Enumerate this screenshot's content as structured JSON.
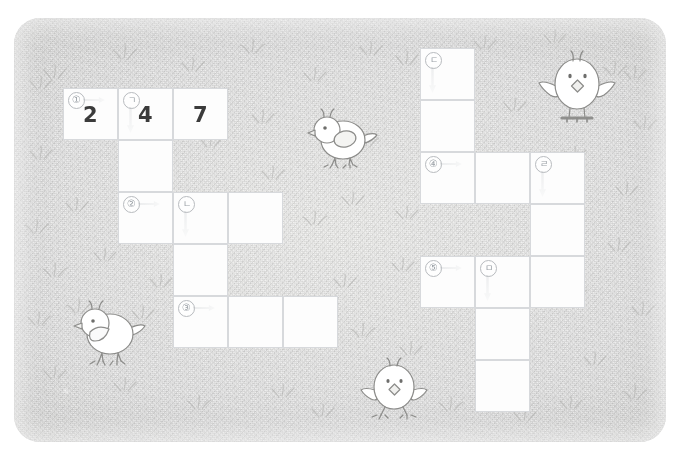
{
  "scene": {
    "title": "Korean crossword puzzle on grass background",
    "background_color": "#dcdcda",
    "card_color": "#fdfdfd",
    "ink_color": "#3b3b3b",
    "marker_color": "#9aa0a6",
    "border_color": "#d7d9dc"
  },
  "puzzle": {
    "name": "gaero-sero-crossword",
    "grids": [
      {
        "name": "left-grid",
        "cells": [
          {
            "id": "L-r1c1",
            "row": 1,
            "col": 1,
            "marker": "①",
            "marker_kind": "number",
            "arrow": "right",
            "value": "2"
          },
          {
            "id": "L-r1c2",
            "row": 1,
            "col": 2,
            "marker": "ㄱ",
            "marker_kind": "korean",
            "arrow": "down",
            "value": "4"
          },
          {
            "id": "L-r1c3",
            "row": 1,
            "col": 3,
            "marker": "",
            "marker_kind": "none",
            "arrow": "none",
            "value": "7"
          },
          {
            "id": "L-r2c2",
            "row": 2,
            "col": 2,
            "marker": "",
            "marker_kind": "none",
            "arrow": "none",
            "value": ""
          },
          {
            "id": "L-r2c3",
            "row": 2,
            "col": 3,
            "marker": "",
            "marker_kind": "none",
            "arrow": "none",
            "value": ""
          },
          {
            "id": "L-r3c2",
            "row": 3,
            "col": 2,
            "marker": "②",
            "marker_kind": "number",
            "arrow": "right",
            "value": ""
          },
          {
            "id": "L-r3c3",
            "row": 3,
            "col": 3,
            "marker": "ㄴ",
            "marker_kind": "korean",
            "arrow": "down",
            "value": ""
          },
          {
            "id": "L-r3c4",
            "row": 3,
            "col": 4,
            "marker": "",
            "marker_kind": "none",
            "arrow": "none",
            "value": ""
          },
          {
            "id": "L-r4c3",
            "row": 4,
            "col": 3,
            "marker": "",
            "marker_kind": "none",
            "arrow": "none",
            "value": ""
          },
          {
            "id": "L-r5c3",
            "row": 5,
            "col": 3,
            "marker": "③",
            "marker_kind": "number",
            "arrow": "right",
            "value": ""
          },
          {
            "id": "L-r5c4",
            "row": 5,
            "col": 4,
            "marker": "",
            "marker_kind": "none",
            "arrow": "none",
            "value": ""
          },
          {
            "id": "L-r5c5",
            "row": 5,
            "col": 5,
            "marker": "",
            "marker_kind": "none",
            "arrow": "none",
            "value": ""
          }
        ]
      },
      {
        "name": "right-grid",
        "cells": [
          {
            "id": "R-r1c1",
            "row": 1,
            "col": 1,
            "marker": "ㄷ",
            "marker_kind": "korean",
            "arrow": "down",
            "value": ""
          },
          {
            "id": "R-r2c1",
            "row": 2,
            "col": 1,
            "marker": "",
            "marker_kind": "none",
            "arrow": "none",
            "value": ""
          },
          {
            "id": "R-r3c1",
            "row": 3,
            "col": 1,
            "marker": "④",
            "marker_kind": "number",
            "arrow": "right",
            "value": ""
          },
          {
            "id": "R-r3c2",
            "row": 3,
            "col": 2,
            "marker": "",
            "marker_kind": "none",
            "arrow": "none",
            "value": ""
          },
          {
            "id": "R-r3c3",
            "row": 3,
            "col": 3,
            "marker": "ㄹ",
            "marker_kind": "korean",
            "arrow": "down",
            "value": ""
          },
          {
            "id": "R-r4c3",
            "row": 4,
            "col": 3,
            "marker": "",
            "marker_kind": "none",
            "arrow": "none",
            "value": ""
          },
          {
            "id": "R-r5c1",
            "row": 5,
            "col": 1,
            "marker": "⑤",
            "marker_kind": "number",
            "arrow": "right",
            "value": ""
          },
          {
            "id": "R-r5c2",
            "row": 5,
            "col": 2,
            "marker": "ㅁ",
            "marker_kind": "korean",
            "arrow": "down",
            "value": ""
          },
          {
            "id": "R-r5c3",
            "row": 5,
            "col": 3,
            "marker": "",
            "marker_kind": "none",
            "arrow": "none",
            "value": ""
          },
          {
            "id": "R-r6c2",
            "row": 6,
            "col": 2,
            "marker": "",
            "marker_kind": "none",
            "arrow": "none",
            "value": ""
          },
          {
            "id": "R-r7c2",
            "row": 7,
            "col": 2,
            "marker": "",
            "marker_kind": "none",
            "arrow": "none",
            "value": ""
          }
        ]
      }
    ],
    "filled_answers": [
      "2",
      "4",
      "7"
    ],
    "across_clue_numbers": [
      "①",
      "②",
      "③",
      "④",
      "⑤"
    ],
    "down_clue_letters": [
      "ㄱ",
      "ㄴ",
      "ㄷ",
      "ㄹ",
      "ㅁ"
    ]
  },
  "chicks": [
    {
      "name": "chick-top-right",
      "pose": "front-wings-out"
    },
    {
      "name": "chick-center",
      "pose": "side-left"
    },
    {
      "name": "chick-bottom-left",
      "pose": "side-left"
    },
    {
      "name": "chick-bottom-center",
      "pose": "front-wings-out"
    }
  ]
}
